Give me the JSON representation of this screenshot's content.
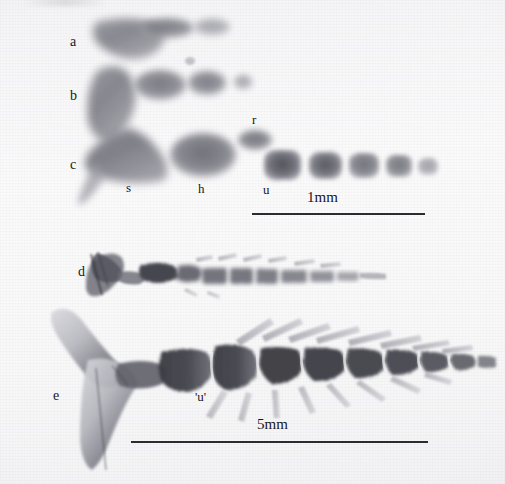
{
  "figure": {
    "kind": "radiograph-specimen-plate",
    "width": 505,
    "height": 484,
    "background_color": "#f8f8f9",
    "ink_color": "#17171a",
    "specimen_color": "#6e6e76"
  },
  "panels": [
    {
      "id": "a",
      "label": "a",
      "x": 70,
      "y": 42,
      "description": "smallest caudal skeleton, hypural plate plus two ossifications"
    },
    {
      "id": "b",
      "label": "b",
      "x": 70,
      "y": 96,
      "description": "caudal skeleton with hypural plate and three centra"
    },
    {
      "id": "c",
      "label": "c",
      "x": 70,
      "y": 165,
      "description": "largest of the upper series, hypural plate plus five centra"
    },
    {
      "id": "d",
      "label": "d",
      "x": 78,
      "y": 272,
      "description": "juvenile vertebral column with caudal fin support"
    },
    {
      "id": "e",
      "label": "e",
      "x": 53,
      "y": 396,
      "description": "adult vertebral column with Y-shaped hypural plate"
    }
  ],
  "structure_labels": [
    {
      "id": "s",
      "label": "s",
      "x": 128,
      "y": 188,
      "meaning": "hypural plate"
    },
    {
      "id": "h",
      "label": "h",
      "x": 200,
      "y": 189,
      "meaning": "haemal element"
    },
    {
      "id": "r",
      "label": "r",
      "x": 254,
      "y": 120,
      "meaning": "radial / epural"
    },
    {
      "id": "u",
      "label": "u",
      "x": 265,
      "y": 190,
      "meaning": "urostyle centrum"
    },
    {
      "id": "u2",
      "label": "'u'",
      "x": 197,
      "y": 397,
      "meaning": "presumed urostyle in adult"
    }
  ],
  "scale_bars": [
    {
      "id": "bar-1mm",
      "label": "1mm",
      "x1": 252,
      "x2": 425,
      "y": 214,
      "label_x": 324,
      "label_y": 197
    },
    {
      "id": "bar-5mm",
      "label": "5mm",
      "x1": 131,
      "x2": 428,
      "y": 442,
      "label_x": 274,
      "label_y": 424
    }
  ]
}
